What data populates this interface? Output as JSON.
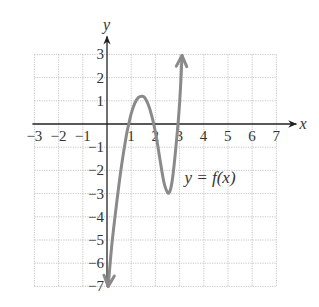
{
  "chart_data": {
    "type": "line",
    "title": "",
    "xlabel": "x",
    "ylabel": "y",
    "xlim": [
      -3,
      7
    ],
    "ylim": [
      -7,
      3
    ],
    "grid": true,
    "x_ticks": [
      -3,
      -2,
      -1,
      1,
      2,
      3,
      4,
      5,
      6,
      7
    ],
    "x_tick_labels": [
      "−3",
      "−2",
      "−1",
      "1",
      "2",
      "3",
      "4",
      "5",
      "6",
      "7"
    ],
    "y_ticks": [
      3,
      2,
      1,
      -1,
      -2,
      -3,
      -4,
      -5,
      -6,
      -7
    ],
    "y_tick_labels": [
      "3",
      "2",
      "1",
      "−1",
      "−2",
      "−3",
      "−4",
      "−5",
      "−6",
      "−7"
    ],
    "annotation": "y = f(x)",
    "series": [
      {
        "name": "y = f(x)",
        "color": "#8a8a8a",
        "arrow_ends": true,
        "x": [
          0.05,
          0.2,
          0.4,
          0.6,
          0.8,
          0.9,
          1.0,
          1.15,
          1.3,
          1.45,
          1.55,
          1.7,
          1.85,
          2.0,
          2.1,
          2.2,
          2.35,
          2.5,
          2.6,
          2.7,
          2.8,
          2.9,
          2.95,
          3.0,
          3.05,
          3.1
        ],
        "y": [
          -7.0,
          -5.2,
          -3.4,
          -1.8,
          -0.5,
          0.0,
          0.45,
          0.9,
          1.15,
          1.2,
          1.15,
          0.85,
          0.35,
          -0.35,
          -0.95,
          -1.6,
          -2.5,
          -2.95,
          -2.9,
          -2.4,
          -1.5,
          -0.4,
          0.2,
          0.9,
          1.8,
          2.95
        ]
      }
    ]
  },
  "labels": {
    "x_axis": "x",
    "y_axis": "y",
    "annotation_lhs": "y = ",
    "annotation_fn": "f(x)"
  }
}
